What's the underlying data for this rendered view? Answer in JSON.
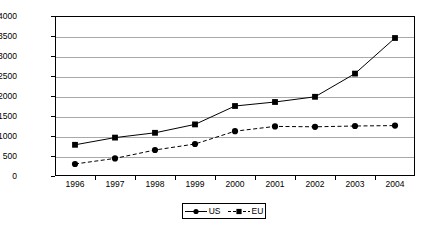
{
  "chart_data": {
    "type": "line",
    "title": "",
    "xlabel": "",
    "ylabel": "$ Millions",
    "categories": [
      "1996",
      "1997",
      "1998",
      "1999",
      "2000",
      "2001",
      "2002",
      "2003",
      "2004"
    ],
    "ylim": [
      0,
      4000
    ],
    "y_ticks": [
      "0",
      "500",
      "1000",
      "1500",
      "2000",
      "2500",
      "3000",
      "3500",
      "4000"
    ],
    "y_tick_values": [
      0,
      500,
      1000,
      1500,
      2000,
      2500,
      3000,
      3500,
      4000
    ],
    "grid": "horizontal",
    "legend_position": "bottom-center",
    "series": [
      {
        "name": "US",
        "line_style": "solid",
        "marker": "square",
        "color": "#000000",
        "values": [
          780,
          960,
          1080,
          1290,
          1750,
          1850,
          1980,
          2560,
          3450
        ]
      },
      {
        "name": "EU",
        "line_style": "dashed",
        "marker": "circle",
        "color": "#000000",
        "values": [
          300,
          440,
          650,
          800,
          1120,
          1240,
          1230,
          1250,
          1260
        ]
      }
    ]
  },
  "legend": {
    "entries": [
      {
        "label": "US",
        "marker": "circle-marker",
        "style": "solid"
      },
      {
        "label": "EU",
        "marker": "square-marker",
        "style": "dashed"
      }
    ]
  },
  "colors": {
    "gridline": "#a9a9a9",
    "axis": "#000000",
    "series": "#000000",
    "background": "#ffffff"
  }
}
